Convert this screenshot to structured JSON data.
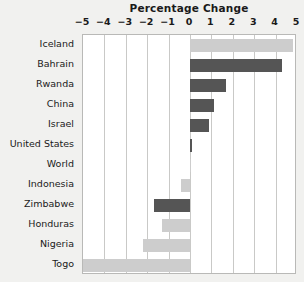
{
  "chart_data": {
    "type": "bar",
    "orientation": "horizontal",
    "title": "Percentage Change",
    "xlabel": "",
    "ylabel": "",
    "xlim": [
      -5,
      5
    ],
    "xticks": [
      -5,
      -4,
      -3,
      -2,
      -1,
      0,
      1,
      2,
      3,
      4,
      5
    ],
    "xtick_labels": [
      "−5",
      "−4",
      "−3",
      "−2",
      "−1",
      "0",
      "1",
      "2",
      "3",
      "4",
      "5"
    ],
    "grid": true,
    "legend": "none",
    "categories": [
      "Iceland",
      "Bahrain",
      "Rwanda",
      "China",
      "Israel",
      "United States",
      "World",
      "Indonesia",
      "Zimbabwe",
      "Honduras",
      "Nigeria",
      "Togo"
    ],
    "values": [
      4.8,
      4.3,
      1.7,
      1.1,
      0.9,
      0.1,
      0.05,
      -0.4,
      -1.7,
      -1.3,
      -2.2,
      -5.0
    ],
    "bar_colors": [
      "#cdcdcd",
      "#555555",
      "#555555",
      "#555555",
      "#555555",
      "#555555",
      "#cdcdcd",
      "#cdcdcd",
      "#555555",
      "#cdcdcd",
      "#cdcdcd",
      "#cdcdcd"
    ],
    "colors": {
      "light_bar": "#cdcdcd",
      "dark_bar": "#555555",
      "plot_background": "#ffffff",
      "page_background": "#f1f1ef",
      "gridline": "#c9c9c7",
      "axis_text": "#1a1a1a"
    }
  }
}
